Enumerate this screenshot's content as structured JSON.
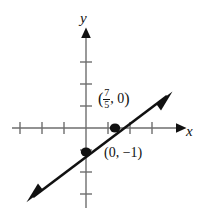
{
  "figure": {
    "background_color": "#ffffff",
    "ink_color": "#111111",
    "axis_color": "#6b6b6b",
    "axes": {
      "x_label": "x",
      "y_label": "y",
      "origin_px": [
        86,
        128
      ],
      "unit_px": 22,
      "x_axis_ticks": [
        -3,
        -2,
        -1,
        1,
        2,
        3
      ],
      "y_axis_ticks": [
        3,
        2,
        1,
        -1,
        -2,
        -3
      ],
      "x_axis_arrow": "right",
      "y_axis_arrow": "up"
    },
    "line": {
      "description": "straight line with arrowheads at both ends",
      "slope": 0.714,
      "y_intercept": -1,
      "x_intercept": 1.4,
      "arrow_start_px": [
        27,
        202
      ],
      "arrow_end_px": [
        172,
        92
      ]
    },
    "points": [
      {
        "name": "x-intercept",
        "label_text": "(7/5, 0)",
        "numerator": "7",
        "denominator": "5",
        "second_coord": "0",
        "open_paren": "(",
        "comma": ",",
        "close_paren": ")",
        "position_px": [
          115,
          128
        ]
      },
      {
        "name": "y-intercept",
        "label_text": "(0, −1)",
        "position_px": [
          86,
          152
        ]
      }
    ]
  }
}
